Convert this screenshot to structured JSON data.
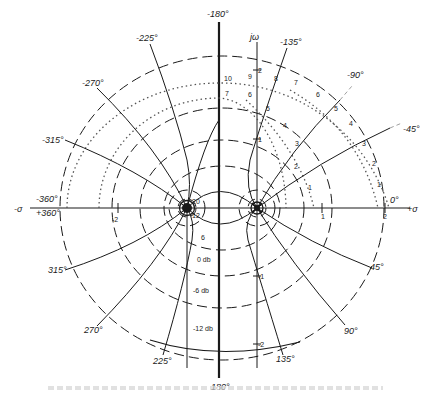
{
  "diagram": {
    "type": "s-plane-root-locus-contours",
    "axes": {
      "real_neg_label": "-σ",
      "real_pos_label": "+σ",
      "imag_label": "jω",
      "real_ticks": [
        {
          "label": "-2",
          "value": -2
        },
        {
          "label": "1",
          "value": 1
        },
        {
          "label": "2",
          "value": 2
        }
      ],
      "imag_ticks": [
        {
          "label": "2",
          "value": 2
        },
        {
          "label": "1",
          "value": 1
        },
        {
          "label": "-1",
          "value": -1
        },
        {
          "label": "-2",
          "value": -2
        }
      ]
    },
    "poles": [
      {
        "label": "pole-left",
        "sigma": -1,
        "omega": 0
      },
      {
        "label": "pole-origin",
        "sigma": 0,
        "omega": 0
      }
    ],
    "magnitude_contours": [
      {
        "label": "20"
      },
      {
        "label": "12"
      },
      {
        "label": "6"
      },
      {
        "label": "0 db"
      },
      {
        "label": "-6 db"
      },
      {
        "label": "-12 db"
      }
    ],
    "phase_contours_upper": [
      {
        "label": "-360°"
      },
      {
        "label": "-315°"
      },
      {
        "label": "-270°"
      },
      {
        "label": "-225°"
      },
      {
        "label": "-180°"
      },
      {
        "label": "-135°"
      },
      {
        "label": "-90°"
      },
      {
        "label": "-45°"
      },
      {
        "label": "0°"
      }
    ],
    "phase_contours_lower": [
      {
        "label": "+360°"
      },
      {
        "label": "315°"
      },
      {
        "label": "270°"
      },
      {
        "label": "225°"
      },
      {
        "label": "180°"
      },
      {
        "label": "135°"
      },
      {
        "label": "90°"
      },
      {
        "label": "45°"
      }
    ],
    "dotted_scale_outer": [
      "1",
      "2",
      "3",
      "4",
      "5",
      "6",
      "7",
      "8",
      "9",
      "10"
    ],
    "dotted_scale_inner": [
      "1",
      "2",
      "3",
      "4",
      "5",
      "6",
      "7"
    ],
    "top_180_label": "-180°",
    "bottom_180_label": "180°"
  }
}
